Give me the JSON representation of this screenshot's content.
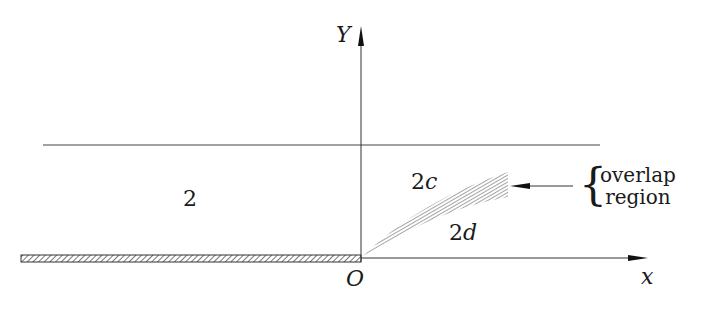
{
  "figure": {
    "axes": {
      "y_label": "Y",
      "x_label": "x",
      "origin_label": "O"
    },
    "regions": {
      "region_2": "2",
      "region_2c": "2c",
      "region_2c_num": "2",
      "region_2c_var": "c",
      "region_2d_num": "2",
      "region_2d_var": "d"
    },
    "annotation": {
      "line1": "overlap",
      "line2": "region",
      "brace": "{"
    },
    "colors": {
      "line": "#333333",
      "hatch": "#555555",
      "background": "#ffffff"
    }
  }
}
